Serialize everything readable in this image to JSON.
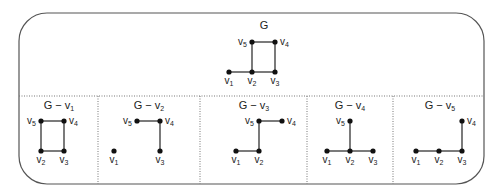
{
  "figure": {
    "main_graph": {
      "title": "G",
      "vertices": [
        {
          "id": "v1",
          "name": "v",
          "sub": "1",
          "x": 229,
          "y": 72
        },
        {
          "id": "v2",
          "name": "v",
          "sub": "2",
          "x": 252,
          "y": 72
        },
        {
          "id": "v3",
          "name": "v",
          "sub": "3",
          "x": 275,
          "y": 72
        },
        {
          "id": "v4",
          "name": "v",
          "sub": "4",
          "x": 275,
          "y": 42
        },
        {
          "id": "v5",
          "name": "v",
          "sub": "5",
          "x": 252,
          "y": 42
        }
      ],
      "edges": [
        [
          "v1",
          "v2"
        ],
        [
          "v2",
          "v3"
        ],
        [
          "v2",
          "v5"
        ],
        [
          "v5",
          "v4"
        ],
        [
          "v4",
          "v3"
        ]
      ]
    },
    "subgraphs": [
      {
        "title_base": "G − v",
        "title_sub": "1",
        "removed": "v1"
      },
      {
        "title_base": "G − v",
        "title_sub": "2",
        "removed": "v2"
      },
      {
        "title_base": "G − v",
        "title_sub": "3",
        "removed": "v3"
      },
      {
        "title_base": "G − v",
        "title_sub": "4",
        "removed": "v4"
      },
      {
        "title_base": "G − v",
        "title_sub": "5",
        "removed": "v5"
      }
    ]
  }
}
